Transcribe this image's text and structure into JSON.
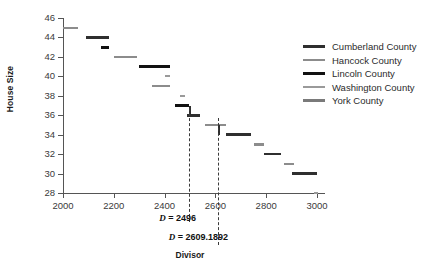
{
  "chart_data": {
    "type": "line",
    "title": "",
    "xlabel": "Divisor",
    "ylabel": "House Size",
    "xlim": [
      2000,
      3000
    ],
    "ylim": [
      28,
      46
    ],
    "xticks": [
      2000,
      2200,
      2400,
      2600,
      2800,
      3000
    ],
    "yticks": [
      28,
      30,
      32,
      34,
      36,
      38,
      40,
      42,
      44,
      46
    ],
    "grid": false,
    "legend_position": "right",
    "legend": [
      {
        "label": "Cumberland County",
        "color": "#2f2f2f",
        "thickness": 2.6
      },
      {
        "label": "Hancock County",
        "color": "#8c8c8c",
        "thickness": 2.4
      },
      {
        "label": "Lincoln County",
        "color": "#111111",
        "thickness": 3.2
      },
      {
        "label": "Washington County",
        "color": "#9a9a9a",
        "thickness": 2.2
      },
      {
        "label": "York County",
        "color": "#7a7a7a",
        "thickness": 2.6
      }
    ],
    "series": [
      {
        "name": "Cumberland County",
        "color": "#2f2f2f",
        "thickness": 2.6,
        "steps": [
          {
            "x0": 2090,
            "x1": 2180,
            "y": 44
          },
          {
            "x0": 2490,
            "x1": 2540,
            "y": 36
          },
          {
            "x0": 2640,
            "x1": 2740,
            "y": 34
          },
          {
            "x0": 2790,
            "x1": 2860,
            "y": 32
          },
          {
            "x0": 2900,
            "x1": 3000,
            "y": 30
          }
        ]
      },
      {
        "name": "Hancock County",
        "color": "#8c8c8c",
        "thickness": 2.4,
        "steps": [
          {
            "x0": 2000,
            "x1": 2060,
            "y": 45
          },
          {
            "x0": 2200,
            "x1": 2290,
            "y": 42
          },
          {
            "x0": 2350,
            "x1": 2420,
            "y": 39
          },
          {
            "x0": 2560,
            "x1": 2640,
            "y": 35
          },
          {
            "x0": 2750,
            "x1": 2790,
            "y": 33
          },
          {
            "x0": 2870,
            "x1": 2910,
            "y": 31
          }
        ]
      },
      {
        "name": "Lincoln County",
        "color": "#111111",
        "thickness": 3.2,
        "steps": [
          {
            "x0": 2150,
            "x1": 2180,
            "y": 43
          },
          {
            "x0": 2300,
            "x1": 2420,
            "y": 41
          },
          {
            "x0": 2440,
            "x1": 2496,
            "y": 37
          }
        ]
      },
      {
        "name": "Washington County",
        "color": "#9a9a9a",
        "thickness": 2.2,
        "steps": [
          {
            "x0": 2400,
            "x1": 2420,
            "y": 40
          },
          {
            "x0": 2460,
            "x1": 2480,
            "y": 38
          },
          {
            "x0": 2990,
            "x1": 3005,
            "y": 28
          }
        ]
      },
      {
        "name": "York County",
        "color": "#7a7a7a",
        "thickness": 2.6,
        "steps": []
      }
    ],
    "annotations": [
      {
        "name": "divisor-line-1",
        "label_prefix": "D",
        "label_eq": " = ",
        "value": "2496",
        "x": 2496
      },
      {
        "name": "divisor-line-2",
        "label_prefix": "D",
        "label_eq": " = ",
        "value": "2609.1892",
        "x": 2609.1892
      }
    ]
  },
  "axes": {
    "y_label": "House Size",
    "x_label": "Divisor",
    "y_tick_labels": [
      "46",
      "44",
      "42",
      "40",
      "38",
      "36",
      "34",
      "32",
      "30",
      "28"
    ],
    "x_tick_labels": [
      "2000",
      "2200",
      "2400",
      "2600",
      "2800",
      "3000"
    ]
  },
  "legend": {
    "items": [
      {
        "label": "Cumberland County"
      },
      {
        "label": "Hancock County"
      },
      {
        "label": "Lincoln County"
      },
      {
        "label": "Washington County"
      },
      {
        "label": "York County"
      }
    ]
  },
  "annotations": {
    "divisor_1": "D = 2496",
    "divisor_2": "D = 2609.1892"
  },
  "colors": {
    "axis": "#555555",
    "text": "#1a1a1a",
    "dash": "#3a3a3a",
    "background": "#ffffff"
  }
}
